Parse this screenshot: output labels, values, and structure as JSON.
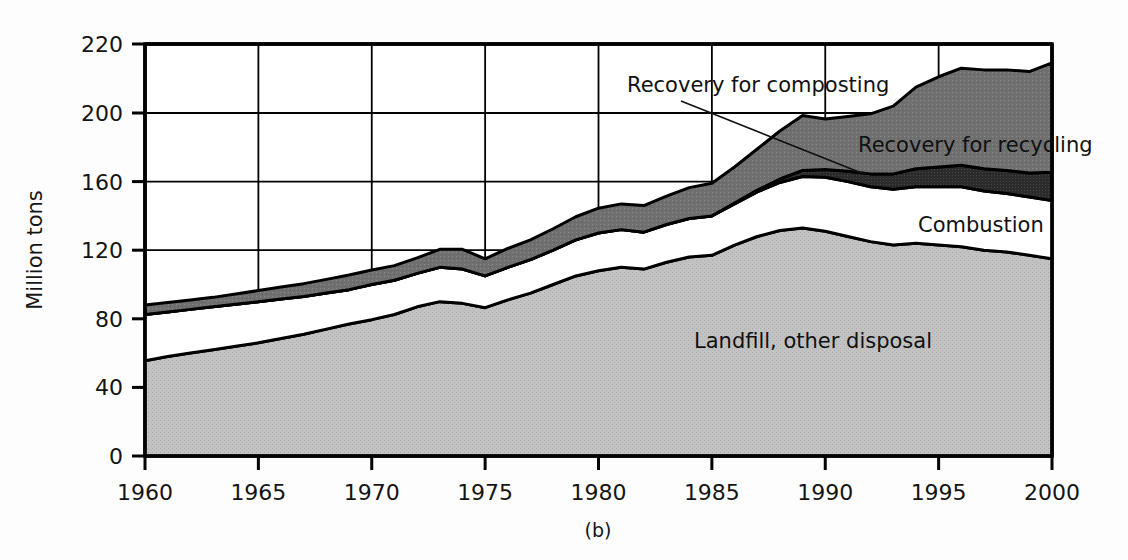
{
  "figure": {
    "caption": "(b)",
    "ylabel": "Million tons"
  },
  "axes": {
    "y_ticks": [
      "220",
      "200",
      "160",
      "120",
      "80",
      "40",
      "0"
    ],
    "x_ticks": [
      "1960",
      "1965",
      "1970",
      "1975",
      "1980",
      "1985",
      "1990",
      "1995",
      "2000"
    ]
  },
  "annotations": {
    "composting": "Recovery for composting",
    "recycling": "Recovery for recycling",
    "combustion": "Combustion",
    "landfill": "Landfill, other disposal"
  },
  "colors": {
    "landfill": "#bdbdbd",
    "combustion": "#ffffff",
    "composting": "#2b2b2b",
    "recycling": "#6f6f6f",
    "outline": "#000000",
    "grid": "#000000",
    "background": "#fdfdfd"
  },
  "chart_data": {
    "type": "area",
    "title": "",
    "subtitle": "",
    "xlabel": "",
    "ylabel": "Million tons",
    "xlim": [
      1960,
      2000
    ],
    "ylim": [
      0,
      220
    ],
    "grid": true,
    "legend_position": "inline-annotations",
    "stacked": true,
    "units": "million tons",
    "x": [
      1960,
      1961,
      1962,
      1963,
      1964,
      1965,
      1966,
      1967,
      1968,
      1969,
      1970,
      1971,
      1972,
      1973,
      1974,
      1975,
      1976,
      1977,
      1978,
      1979,
      1980,
      1981,
      1982,
      1983,
      1984,
      1985,
      1986,
      1987,
      1988,
      1989,
      1990,
      1991,
      1992,
      1993,
      1994,
      1995,
      1996,
      1997,
      1998,
      1999,
      2000
    ],
    "series": [
      {
        "name": "Landfill, other disposal",
        "fill": "#bdbdbd",
        "values": [
          55.5,
          58.0,
          60.0,
          62.0,
          64.0,
          66.0,
          68.5,
          71.0,
          74.0,
          77.0,
          79.5,
          82.5,
          87.0,
          90.0,
          89.0,
          86.5,
          91.0,
          95.0,
          100.0,
          105.0,
          108.0,
          110.0,
          109.0,
          113.0,
          116.0,
          117.0,
          123.0,
          128.0,
          131.5,
          133.0,
          131.0,
          128.0,
          125.0,
          123.0,
          124.0,
          123.0,
          122.0,
          120.0,
          119.0,
          117.0,
          115.0
        ]
      },
      {
        "name": "Combustion",
        "fill": "#ffffff",
        "values": [
          27.0,
          26.0,
          25.5,
          25.0,
          24.5,
          24.0,
          23.0,
          22.0,
          21.0,
          20.0,
          20.5,
          20.0,
          19.5,
          20.0,
          20.0,
          18.5,
          19.0,
          19.5,
          20.0,
          21.0,
          22.0,
          22.0,
          21.5,
          22.0,
          22.5,
          23.0,
          24.0,
          26.0,
          28.0,
          30.0,
          31.5,
          32.0,
          32.0,
          32.5,
          33.0,
          34.0,
          35.0,
          34.5,
          34.0,
          34.0,
          34.0
        ]
      },
      {
        "name": "Recovery for composting",
        "fill": "#2b2b2b",
        "values": [
          0,
          0,
          0,
          0,
          0,
          0,
          0,
          0,
          0,
          0,
          0,
          0,
          0,
          0,
          0,
          0,
          0,
          0,
          0,
          0,
          0,
          0,
          0,
          0,
          0,
          0,
          0.5,
          1.0,
          2.0,
          3.5,
          4.5,
          6.0,
          7.5,
          9.0,
          10.5,
          11.5,
          12.5,
          13.0,
          13.5,
          14.0,
          16.5
        ]
      },
      {
        "name": "Recovery for recycling",
        "fill": "#6f6f6f",
        "values": [
          5.5,
          5.5,
          5.5,
          5.5,
          6.0,
          6.5,
          7.0,
          7.5,
          8.0,
          8.5,
          8.5,
          8.5,
          9.0,
          10.5,
          11.5,
          10.0,
          11.0,
          11.5,
          12.5,
          13.5,
          14.5,
          15.0,
          15.5,
          16.5,
          18.0,
          19.0,
          21.0,
          24.0,
          28.0,
          32.0,
          29.5,
          32.0,
          35.0,
          37.5,
          40.0,
          42.0,
          43.5,
          45.0,
          46.0,
          47.0,
          49.0
        ]
      }
    ],
    "totals": [
      88,
      89.5,
      91,
      92.5,
      94.5,
      96.5,
      98.5,
      100.5,
      103,
      105.5,
      108.5,
      111,
      115.5,
      120.5,
      120.5,
      115,
      121,
      126,
      132.5,
      139.5,
      144.5,
      147,
      146,
      151.5,
      156.5,
      159,
      168.5,
      179,
      189.5,
      198.5,
      196.5,
      198,
      199.5,
      202,
      207.5,
      210.5,
      213,
      212.5,
      212.5,
      212,
      214.5
    ]
  }
}
